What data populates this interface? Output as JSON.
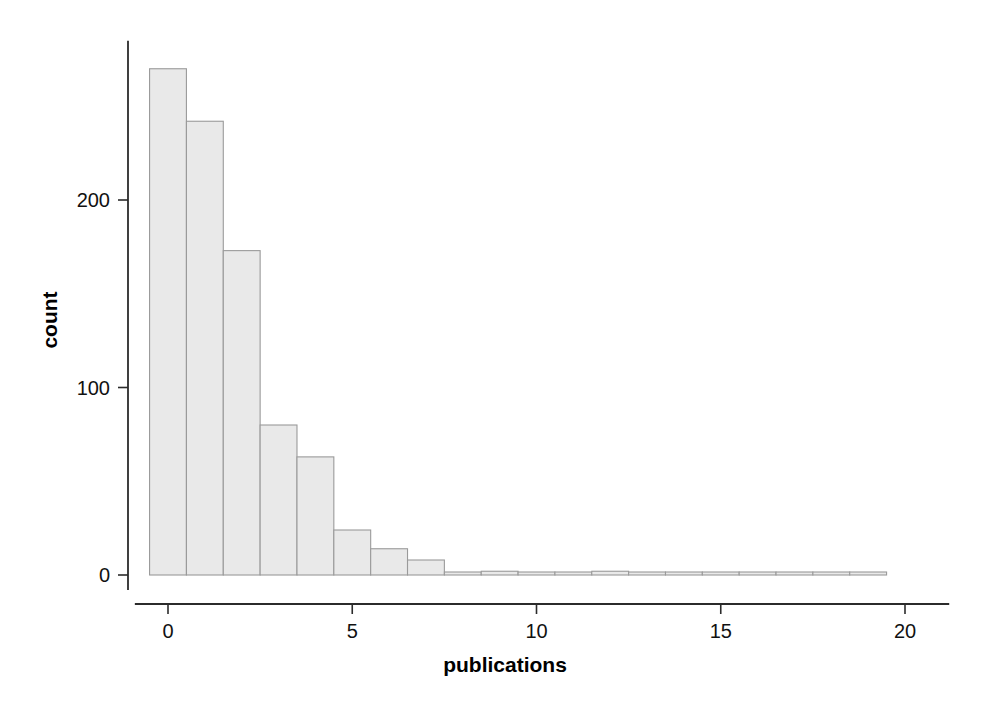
{
  "chart_data": {
    "type": "bar",
    "title": "",
    "subtitle": "",
    "xlabel": "publications",
    "ylabel": "count",
    "xlim": [
      -0.9,
      21.2
    ],
    "ylim": [
      -8,
      285
    ],
    "grid": false,
    "legend": null,
    "bin_width": 1,
    "orientation": "vertical",
    "bar_fill_color": "#e9e9e9",
    "bar_edge_color": "#9a9a9a",
    "axis_color": "#2b2b2b",
    "x_ticks": [
      {
        "value": 0,
        "label": "0"
      },
      {
        "value": 5,
        "label": "5"
      },
      {
        "value": 10,
        "label": "10"
      },
      {
        "value": 15,
        "label": "15"
      },
      {
        "value": 20,
        "label": "20"
      }
    ],
    "y_ticks": [
      {
        "value": 0,
        "label": "0"
      },
      {
        "value": 100,
        "label": "100"
      },
      {
        "value": 200,
        "label": "200"
      }
    ],
    "categories": [
      0,
      1,
      2,
      3,
      4,
      5,
      6,
      7,
      8,
      9,
      10,
      11,
      12,
      13,
      14,
      15,
      16,
      17,
      18,
      19
    ],
    "values": [
      270,
      242,
      173,
      80,
      63,
      24,
      14,
      8,
      0,
      2,
      0,
      0,
      2,
      0,
      0,
      0,
      1,
      0,
      0,
      1
    ],
    "bins": [
      {
        "left": -0.5,
        "right": 0.5,
        "center": 0,
        "count": 270
      },
      {
        "left": 0.5,
        "right": 1.5,
        "center": 1,
        "count": 242
      },
      {
        "left": 1.5,
        "right": 2.5,
        "center": 2,
        "count": 173
      },
      {
        "left": 2.5,
        "right": 3.5,
        "center": 3,
        "count": 80
      },
      {
        "left": 3.5,
        "right": 4.5,
        "center": 4,
        "count": 63
      },
      {
        "left": 4.5,
        "right": 5.5,
        "center": 5,
        "count": 24
      },
      {
        "left": 5.5,
        "right": 6.5,
        "center": 6,
        "count": 14
      },
      {
        "left": 6.5,
        "right": 7.5,
        "center": 7,
        "count": 8
      },
      {
        "left": 7.5,
        "right": 8.5,
        "center": 8,
        "count": 0
      },
      {
        "left": 8.5,
        "right": 9.5,
        "center": 9,
        "count": 2
      },
      {
        "left": 9.5,
        "right": 10.5,
        "center": 10,
        "count": 0
      },
      {
        "left": 10.5,
        "right": 11.5,
        "center": 11,
        "count": 0
      },
      {
        "left": 11.5,
        "right": 12.5,
        "center": 12,
        "count": 2
      },
      {
        "left": 12.5,
        "right": 13.5,
        "center": 13,
        "count": 0
      },
      {
        "left": 13.5,
        "right": 14.5,
        "center": 14,
        "count": 0
      },
      {
        "left": 14.5,
        "right": 15.5,
        "center": 15,
        "count": 0
      },
      {
        "left": 15.5,
        "right": 16.5,
        "center": 16,
        "count": 1
      },
      {
        "left": 16.5,
        "right": 17.5,
        "center": 17,
        "count": 0
      },
      {
        "left": 17.5,
        "right": 18.5,
        "center": 18,
        "count": 0
      },
      {
        "left": 18.5,
        "right": 19.5,
        "center": 19,
        "count": 1
      }
    ]
  }
}
